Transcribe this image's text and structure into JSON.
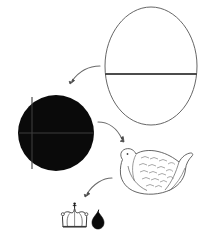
{
  "scene": {
    "title": "Egg to hen transformation sequence diagram",
    "canvas_width": 202,
    "canvas_height": 236,
    "background_color": "#ffffff",
    "outline_color": "#555555",
    "fill_black": "#0a0a0a",
    "arrow_color": "#666666"
  },
  "objects": [
    {
      "id": "egg",
      "name": "egg-outline",
      "label": "Egg",
      "style": "outline",
      "center_x": 151,
      "center_y": 66,
      "width": 92,
      "height": 118,
      "has_equator_line": true,
      "equator_y": 74,
      "equator_color": "#111111"
    },
    {
      "id": "circle",
      "name": "black-circle",
      "label": "Black circle",
      "style": "filled",
      "center_x": 56,
      "center_y": 133,
      "radius": 38,
      "fill": "#0a0a0a",
      "has_crosshair": true,
      "crosshair_color": "#3a3a3a"
    },
    {
      "id": "hen",
      "name": "hen-outline",
      "label": "Hen",
      "style": "outline",
      "center_x": 152,
      "center_y": 172,
      "width": 78,
      "height": 56
    },
    {
      "id": "crown",
      "name": "crown-outline",
      "label": "Crown",
      "style": "outline",
      "center_x": 75,
      "center_y": 218,
      "width": 26,
      "height": 26
    },
    {
      "id": "droplet",
      "name": "black-droplet",
      "label": "Droplet",
      "style": "filled",
      "center_x": 98,
      "center_y": 220,
      "width": 12,
      "height": 17,
      "fill": "#0a0a0a"
    }
  ],
  "arrows": [
    {
      "id": "arrow-1",
      "name": "arrow-egg-to-circle",
      "from": "egg",
      "to": "circle",
      "direction": "down-left"
    },
    {
      "id": "arrow-2",
      "name": "arrow-circle-to-hen",
      "from": "circle",
      "to": "hen",
      "direction": "down-right"
    },
    {
      "id": "arrow-3",
      "name": "arrow-hen-to-crown",
      "from": "hen",
      "to": "crown",
      "direction": "down-left"
    }
  ]
}
